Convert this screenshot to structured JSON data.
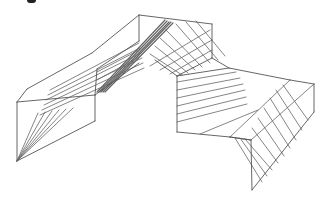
{
  "figure": {
    "stroke_color": "#555555",
    "hatch_color": "#666666",
    "background": "#ffffff",
    "width": 329,
    "height": 201
  },
  "outline_segments": [
    [
      27,
      89,
      92,
      53
    ],
    [
      92,
      53,
      139,
      15
    ],
    [
      139,
      15,
      212,
      24
    ],
    [
      212,
      24,
      212,
      58
    ],
    [
      27,
      89,
      17,
      102
    ],
    [
      17,
      102,
      17,
      161
    ],
    [
      17,
      102,
      95,
      95
    ],
    [
      95,
      95,
      95,
      121
    ],
    [
      95,
      95,
      139,
      63
    ],
    [
      17,
      161,
      95,
      121
    ],
    [
      139,
      15,
      139,
      41
    ],
    [
      139,
      41,
      97,
      69
    ],
    [
      97,
      69,
      95,
      95
    ],
    [
      212,
      58,
      177,
      76
    ],
    [
      177,
      76,
      177,
      132
    ],
    [
      177,
      76,
      229,
      68
    ],
    [
      229,
      68,
      290,
      80
    ],
    [
      290,
      80,
      314,
      84
    ],
    [
      314,
      84,
      314,
      112
    ],
    [
      177,
      132,
      230,
      137
    ],
    [
      230,
      137,
      251,
      140
    ],
    [
      251,
      140,
      252,
      190
    ],
    [
      252,
      190,
      314,
      112
    ],
    [
      230,
      137,
      251,
      140
    ],
    [
      212,
      58,
      229,
      68
    ],
    [
      155,
      60,
      177,
      76
    ]
  ],
  "hatch_groups": [
    {
      "name": "left-roof-hatch",
      "lines": [
        [
          50,
          90,
          139,
          43
        ],
        [
          48,
          95,
          140,
          48
        ],
        [
          46,
          100,
          141,
          53
        ],
        [
          44,
          105,
          142,
          58
        ],
        [
          42,
          110,
          143,
          63
        ],
        [
          40,
          115,
          144,
          68
        ],
        [
          97,
          72,
          139,
          50
        ],
        [
          97,
          80,
          139,
          57
        ]
      ]
    },
    {
      "name": "left-fan-hatch",
      "lines": [
        [
          17,
          161,
          38,
          113
        ],
        [
          17,
          161,
          45,
          112
        ],
        [
          17,
          161,
          52,
          111
        ],
        [
          17,
          161,
          59,
          110
        ],
        [
          17,
          161,
          66,
          109
        ],
        [
          17,
          161,
          73,
          108
        ]
      ]
    },
    {
      "name": "ridge-dense",
      "lines": [
        [
          97,
          92,
          165,
          20
        ],
        [
          99,
          92,
          167,
          21
        ],
        [
          101,
          92,
          169,
          22
        ],
        [
          103,
          92,
          171,
          22
        ],
        [
          105,
          92,
          173,
          23
        ]
      ]
    },
    {
      "name": "center-diag-hatch",
      "lines": [
        [
          196,
          21,
          225,
          56
        ],
        [
          186,
          22,
          218,
          60
        ],
        [
          176,
          24,
          210,
          63
        ],
        [
          166,
          30,
          202,
          67
        ],
        [
          160,
          38,
          195,
          70
        ],
        [
          155,
          46,
          188,
          73
        ],
        [
          150,
          54,
          182,
          75
        ]
      ]
    },
    {
      "name": "center-cross-hatch",
      "lines": [
        [
          150,
          66,
          210,
          30
        ],
        [
          160,
          70,
          212,
          40
        ],
        [
          170,
          74,
          212,
          50
        ]
      ]
    },
    {
      "name": "mid-panel-hatch",
      "lines": [
        [
          177,
          82,
          236,
          72
        ],
        [
          177,
          90,
          240,
          78
        ],
        [
          177,
          98,
          243,
          84
        ],
        [
          177,
          106,
          245,
          90
        ],
        [
          177,
          114,
          246,
          97
        ],
        [
          177,
          122,
          247,
          104
        ],
        [
          200,
          134,
          258,
          110
        ]
      ]
    },
    {
      "name": "right-panel-hatch",
      "lines": [
        [
          235,
          138,
          262,
          182
        ],
        [
          240,
          138,
          267,
          176
        ],
        [
          245,
          139,
          272,
          170
        ],
        [
          252,
          128,
          278,
          163
        ],
        [
          258,
          118,
          284,
          156
        ],
        [
          264,
          108,
          290,
          148
        ],
        [
          270,
          98,
          296,
          140
        ],
        [
          276,
          90,
          302,
          130
        ],
        [
          283,
          85,
          308,
          120
        ]
      ]
    },
    {
      "name": "right-cap-hatch",
      "lines": [
        [
          230,
          137,
          290,
          80
        ],
        [
          251,
          140,
          314,
          84
        ]
      ]
    }
  ]
}
